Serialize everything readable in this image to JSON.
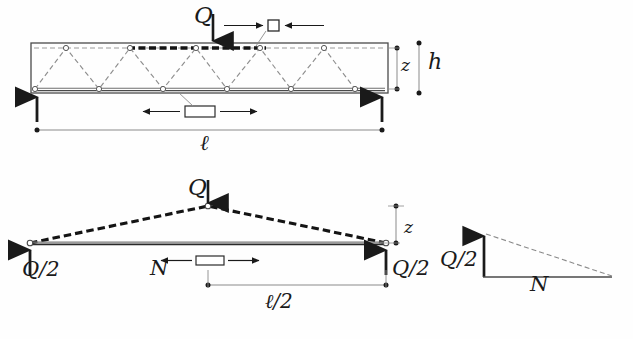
{
  "figure": {
    "background_color": "#fefefe",
    "ink_color": "#1a1a1a",
    "line_color": "#555555",
    "width": 633,
    "height": 339
  },
  "top_diagram": {
    "name": "truss-beam-elevation",
    "load_label": "Q",
    "depth_inner_label": "z",
    "depth_outer_label": "h",
    "span_label": "ℓ",
    "compression_marker": {
      "name": "compression-element",
      "shape": "square",
      "arrow_direction": "inward",
      "chord": "top"
    },
    "tension_marker": {
      "name": "tension-element",
      "shape": "rectangle",
      "arrow_direction": "outward",
      "chord": "bottom"
    },
    "geometry": {
      "box_left": 31,
      "box_right": 388,
      "box_top": 43,
      "box_bottom": 93,
      "top_chord_y": 48,
      "bottom_chord_y": 89,
      "top_nodes_x": [
        66,
        130,
        196,
        260,
        324
      ],
      "bottom_nodes_x": [
        35,
        99,
        163,
        227,
        291,
        355
      ],
      "load_x": 196,
      "support_left_x": 37,
      "support_right_x": 382
    }
  },
  "bottom_diagram": {
    "name": "free-body-half-truss",
    "load_label": "Q",
    "reaction_left_label": "Q/2",
    "reaction_right_label": "Q/2",
    "axial_force_label": "N",
    "lever_arm_label": "z",
    "half_span_label": "ℓ/2",
    "geometry": {
      "left_node_x": 30,
      "right_node_x": 386,
      "chord_y": 243,
      "apex_x": 208,
      "apex_y": 206
    }
  },
  "force_triangle": {
    "name": "force-polygon",
    "vertical_label": "Q/2",
    "horizontal_label": "N",
    "hypotenuse_style": "dashed",
    "geometry": {
      "origin_x": 484,
      "origin_y": 277,
      "top_y": 234,
      "right_x": 612
    }
  }
}
